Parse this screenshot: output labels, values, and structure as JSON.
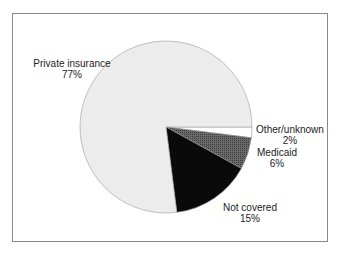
{
  "chart_data": {
    "type": "pie",
    "title": "",
    "slices": [
      {
        "label": "Other/unknown",
        "value": 2,
        "value_label": "2%",
        "color": "#ffffff"
      },
      {
        "label": "Medicaid",
        "value": 6,
        "value_label": "6%",
        "color": "#555555"
      },
      {
        "label": "Not covered",
        "value": 15,
        "value_label": "15%",
        "color": "#0a0a0a"
      },
      {
        "label": "Private insurance",
        "value": 77,
        "value_label": "77%",
        "color": "#ececec"
      }
    ],
    "start_angle_deg": 0,
    "direction": "clockwise",
    "legend": "none (direct labels)"
  },
  "labels": {
    "private": {
      "name": "Private insurance",
      "pct": "77%"
    },
    "other": {
      "name": "Other/unknown",
      "pct": "2%"
    },
    "medicaid": {
      "name": "Medicaid",
      "pct": "6%"
    },
    "not_covered": {
      "name": "Not covered",
      "pct": "15%"
    }
  }
}
